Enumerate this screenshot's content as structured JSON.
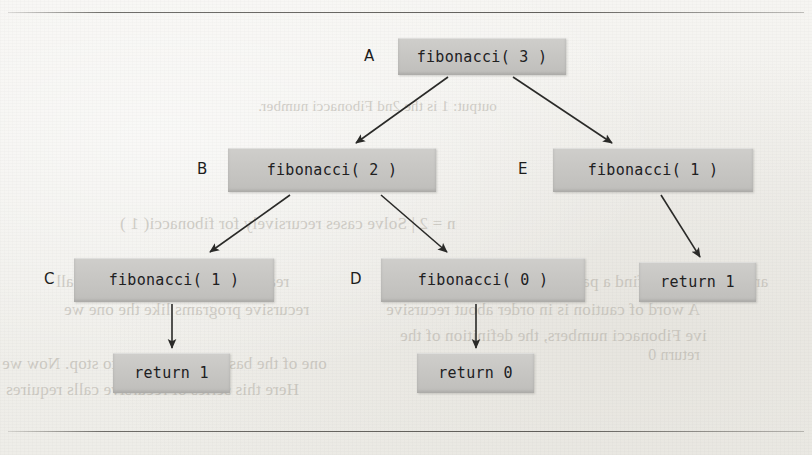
{
  "page": {
    "background_color": "#f1f0ec",
    "node_fill_color": "#c9c8c6",
    "ink_color": "#20201f"
  },
  "rules": [
    {
      "name": "top-rule",
      "y": 12
    },
    {
      "name": "bottom-rule",
      "y": 431
    }
  ],
  "diagram": {
    "type": "recursion-tree",
    "nodes": [
      {
        "id": "A",
        "label": "A",
        "text": "fibonacci( 3 )",
        "x": 398,
        "y": 38,
        "w": 168,
        "h": 37,
        "label_x": 364,
        "label_y": 47
      },
      {
        "id": "B",
        "label": "B",
        "text": "fibonacci( 2 )",
        "x": 228,
        "y": 148,
        "w": 208,
        "h": 44,
        "label_x": 197,
        "label_y": 160
      },
      {
        "id": "E",
        "label": "E",
        "text": "fibonacci( 1 )",
        "x": 553,
        "y": 148,
        "w": 200,
        "h": 44,
        "label_x": 518,
        "label_y": 160
      },
      {
        "id": "C",
        "label": "C",
        "text": "fibonacci( 1 )",
        "x": 74,
        "y": 258,
        "w": 200,
        "h": 44,
        "label_x": 44,
        "label_y": 270
      },
      {
        "id": "D",
        "label": "D",
        "text": "fibonacci( 0 )",
        "x": 381,
        "y": 258,
        "w": 204,
        "h": 44,
        "label_x": 350,
        "label_y": 270
      },
      {
        "id": "R1",
        "label": "",
        "text": "return 1",
        "x": 639,
        "y": 262,
        "w": 117,
        "h": 40,
        "label_x": 0,
        "label_y": 0
      },
      {
        "id": "R2",
        "label": "",
        "text": "return 1",
        "x": 113,
        "y": 353,
        "w": 117,
        "h": 40,
        "label_x": 0,
        "label_y": 0
      },
      {
        "id": "R3",
        "label": "",
        "text": "return 0",
        "x": 417,
        "y": 353,
        "w": 117,
        "h": 40,
        "label_x": 0,
        "label_y": 0
      }
    ],
    "edges": [
      {
        "name": "edge-a-to-b",
        "x1": 448,
        "y1": 77,
        "x2": 356,
        "y2": 143
      },
      {
        "name": "edge-a-to-e",
        "x1": 513,
        "y1": 77,
        "x2": 612,
        "y2": 143
      },
      {
        "name": "edge-b-to-c",
        "x1": 290,
        "y1": 195,
        "x2": 210,
        "y2": 252
      },
      {
        "name": "edge-b-to-d",
        "x1": 381,
        "y1": 195,
        "x2": 447,
        "y2": 252
      },
      {
        "name": "edge-e-to-return1",
        "x1": 661,
        "y1": 195,
        "x2": 700,
        "y2": 257
      },
      {
        "name": "edge-c-to-return1",
        "x1": 172,
        "y1": 304,
        "x2": 172,
        "y2": 348
      },
      {
        "name": "edge-d-to-return0",
        "x1": 476,
        "y1": 304,
        "x2": 476,
        "y2": 348
      }
    ]
  },
  "bleed_text": [
    {
      "text": "output: 1 is the 2nd Fibonacci number.",
      "x": 258,
      "y": 98,
      "size": 15
    },
    {
      "text": "n = 2    |  Solve cases recursively for fibonacci( 1 )",
      "x": 120,
      "y": 214,
      "size": 17
    },
    {
      "text": "and see if we can find a pattern in the recursion.",
      "x": 432,
      "y": 272,
      "size": 17
    },
    {
      "text": "A word of caution is in order about recursive",
      "x": 386,
      "y": 300,
      "size": 17
    },
    {
      "text": "ive Fibonacci numbers, the definition of the",
      "x": 400,
      "y": 326,
      "size": 17
    },
    {
      "text": "one of the base case ( 0 or 1 ) to stop. Now we",
      "x": 2,
      "y": 354,
      "size": 17
    },
    {
      "text": "Here this series of recursive calls requires",
      "x": 6,
      "y": 380,
      "size": 17
    },
    {
      "text": "recursive programs like the one we",
      "x": 64,
      "y": 300,
      "size": 17
    },
    {
      "text": "reaches the base case and the call",
      "x": 56,
      "y": 272,
      "size": 17
    },
    {
      "text": "return 0",
      "x": 648,
      "y": 346,
      "size": 16
    }
  ]
}
